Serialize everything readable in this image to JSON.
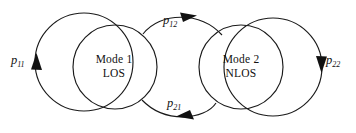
{
  "diagram": {
    "type": "markov-chain-state-transition",
    "title": "",
    "background_color": "#ffffff",
    "stroke_color": "#1a1a1a",
    "text_color": "#111111",
    "nodes": [
      {
        "id": "mode1",
        "line1": "Mode 1",
        "line2": "LOS",
        "cx": 115,
        "cy": 67,
        "r": 42
      },
      {
        "id": "mode2",
        "line1": "Mode 2",
        "line2": "NLOS",
        "cx": 241,
        "cy": 67,
        "r": 42
      }
    ],
    "transitions": [
      {
        "id": "p11",
        "base": "p",
        "subscript": "11",
        "from": "mode1",
        "to": "mode1",
        "kind": "self-loop-left",
        "arrow_direction": "up"
      },
      {
        "id": "p12",
        "base": "p",
        "subscript": "12",
        "from": "mode1",
        "to": "mode2",
        "kind": "arc-top",
        "arrow_direction": "right"
      },
      {
        "id": "p21",
        "base": "p",
        "subscript": "21",
        "from": "mode2",
        "to": "mode1",
        "kind": "arc-bottom",
        "arrow_direction": "left"
      },
      {
        "id": "p22",
        "base": "p",
        "subscript": "22",
        "from": "mode2",
        "to": "mode2",
        "kind": "self-loop-right",
        "arrow_direction": "down"
      }
    ]
  }
}
